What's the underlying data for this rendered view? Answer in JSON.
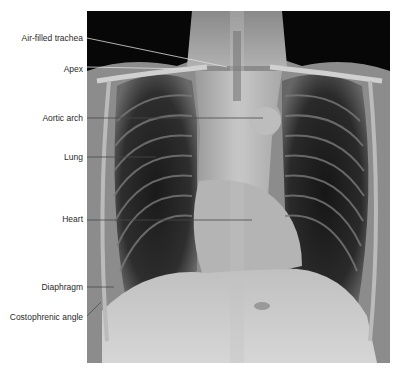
{
  "figure": {
    "type": "annotated chest X-ray (PA view)",
    "labels": [
      {
        "id": "trachea",
        "text": "Air-filled trachea"
      },
      {
        "id": "apex",
        "text": "Apex"
      },
      {
        "id": "aortic_arch",
        "text": "Aortic arch"
      },
      {
        "id": "lung",
        "text": "Lung"
      },
      {
        "id": "heart",
        "text": "Heart"
      },
      {
        "id": "diaphragm",
        "text": "Diaphragm"
      },
      {
        "id": "costophrenic",
        "text": "Costophrenic angle"
      }
    ],
    "colors": {
      "leader_line": "#4a4a4a",
      "label_text": "#2a2a2a",
      "background": "#ffffff"
    }
  }
}
